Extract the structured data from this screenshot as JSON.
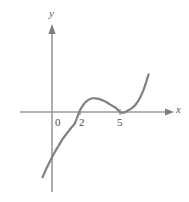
{
  "figure": {
    "background_color": "#ffffff",
    "curve_color": "#808080",
    "axis_color": "#9a9a9a",
    "label_color": "#4a4a4a"
  },
  "axes": {
    "x_label": "x",
    "y_label": "y",
    "x_tick_labels": [
      "0",
      "2",
      "5"
    ],
    "x_tick_values": [
      0,
      2,
      5
    ],
    "y_tick_labels": [],
    "origin_label": "0",
    "x_arrow": true,
    "y_arrow": true
  },
  "chart_data": {
    "type": "line",
    "title": "",
    "xlabel": "x",
    "ylabel": "y",
    "grid": false,
    "legend": null,
    "xlim": [
      -1.2,
      7.6
    ],
    "ylim": [
      -12,
      12
    ],
    "xticks": [
      0,
      2,
      5
    ],
    "yticks": [],
    "roots": [
      2,
      5
    ],
    "root_multiplicities": [
      1,
      2
    ],
    "local_maximum": {
      "x": 3.0,
      "y": 1.8
    },
    "local_minimum": {
      "x": 5.0,
      "y": 0.0
    },
    "series": [
      {
        "name": "f(x) = (x - 2)(x - 5)^2 / 4",
        "x": [
          -0.7,
          -0.4,
          -0.1,
          0.2,
          0.5,
          0.8,
          1.1,
          1.4,
          1.7,
          2.0,
          2.3,
          2.6,
          2.9,
          3.2,
          3.5,
          3.8,
          4.1,
          4.4,
          4.7,
          5.0,
          5.3,
          5.6,
          5.9,
          6.2,
          6.5,
          6.8,
          7.1
        ],
        "y": [
          -8.6,
          -7.4,
          -6.3,
          -5.3,
          -4.4,
          -3.5,
          -2.8,
          -2.1,
          -1.4,
          0.0,
          0.95,
          1.5,
          1.77,
          1.8,
          1.69,
          1.48,
          1.19,
          0.86,
          0.53,
          0.0,
          -0.08,
          0.22,
          0.53,
          1.09,
          1.97,
          3.24,
          4.96
        ]
      }
    ]
  }
}
